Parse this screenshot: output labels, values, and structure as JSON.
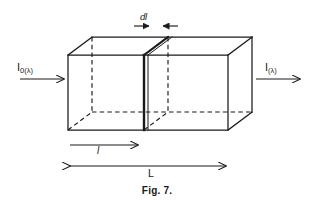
{
  "figure": {
    "caption": "Fig. 7.",
    "background_color": "#ffffff",
    "line_color": "#1a1a1a",
    "labels": {
      "slab_thickness": "d",
      "slab_thickness_italic_l": "l",
      "incident_intensity_symbol": "I",
      "incident_intensity_subscript": "0(λ)",
      "transmitted_intensity_symbol": "I",
      "transmitted_intensity_subscript": "(λ)",
      "path_length_short": "l",
      "path_length_total": "L"
    }
  },
  "diagram_data": {
    "type": "diagram",
    "subject": "Beer-Lambert absorption cuvette: rectangular box with an infinitesimal slab of thickness dl at distance l from the entrance face",
    "projection": "oblique-cabinet",
    "depth_offset": {
      "dx": 24,
      "dy": -18
    },
    "box": {
      "front_face": {
        "left": 68,
        "top": 55,
        "right": 228,
        "bottom": 130
      },
      "back_face": {
        "left": 92,
        "top": 37,
        "right": 252,
        "bottom": 112
      },
      "hidden_edges": [
        "back-left-vertical",
        "back-bottom-horizontal",
        "back-left-depth-bottom"
      ]
    },
    "slab": {
      "front_x": 144,
      "back_x": 168,
      "top_front_y": 55,
      "bottom_front_y": 130,
      "top_back_y": 37,
      "bottom_back_y": 112,
      "thickness_label": "dl",
      "emphasis": "bold-front-edge"
    },
    "arrows": [
      {
        "name": "incident-beam",
        "from": [
          22,
          79
        ],
        "to": [
          66,
          79
        ],
        "style": "single-head-right"
      },
      {
        "name": "transmitted-beam",
        "from": [
          258,
          79
        ],
        "to": [
          302,
          79
        ],
        "style": "single-head-right"
      },
      {
        "name": "path-length-l",
        "from": [
          70,
          145
        ],
        "to": [
          140,
          145
        ],
        "style": "single-head-right"
      },
      {
        "name": "path-length-L",
        "from": [
          68,
          166
        ],
        "to": [
          228,
          166
        ],
        "style": "double-head"
      },
      {
        "name": "dl-left-tick",
        "from": [
          136,
          26
        ],
        "to": [
          152,
          26
        ],
        "style": "single-head-right"
      },
      {
        "name": "dl-right-tick",
        "from": [
          176,
          26
        ],
        "to": [
          160,
          26
        ],
        "style": "single-head-left"
      }
    ],
    "axis_ranges": {
      "x": [
        0,
        314
      ],
      "y": [
        0,
        206
      ]
    },
    "grid": false,
    "legend": null
  }
}
